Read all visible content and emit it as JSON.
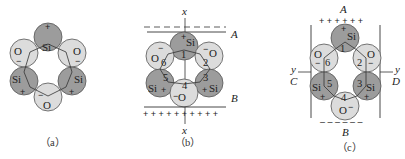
{
  "figure": {
    "colors": {
      "si_fill": "#9c9c9c",
      "o_fill": "#dcdcdc",
      "stroke": "#555555",
      "line": "#333333"
    },
    "panels": [
      {
        "id": "a",
        "caption": "（a）",
        "atoms": [
          {
            "element": "Si",
            "charge": "+"
          },
          {
            "element": "O",
            "charge": "−"
          },
          {
            "element": "Si",
            "charge": "+"
          },
          {
            "element": "O",
            "charge": "−"
          },
          {
            "element": "Si",
            "charge": "+"
          },
          {
            "element": "O",
            "charge": "−"
          }
        ]
      },
      {
        "id": "b",
        "caption": "（b）",
        "axis_label_top": "x",
        "axis_label_bottom": "x",
        "plate_top_label": "A",
        "plate_bottom_label": "B",
        "plate_top_charges": "– – – – – – – – –",
        "plate_bottom_charges": "+ + + + +  + + + + +",
        "atom_numbers": [
          "1",
          "2",
          "3",
          "4",
          "5",
          "6"
        ],
        "atoms": [
          {
            "element": "Si",
            "charge": "+",
            "number": "1"
          },
          {
            "element": "O",
            "charge": "−",
            "number": "2"
          },
          {
            "element": "Si",
            "charge": "+",
            "number": "3"
          },
          {
            "element": "O",
            "charge": "−",
            "number": "4"
          },
          {
            "element": "Si",
            "charge": "+",
            "number": "5"
          },
          {
            "element": "O",
            "charge": "−",
            "number": "6"
          }
        ]
      },
      {
        "id": "c",
        "caption": "（c）",
        "axis_label_left": "y",
        "axis_label_right": "y",
        "top_label": "A",
        "bottom_label": "B",
        "left_label": "C",
        "right_label": "D",
        "top_charges": "+ + + + + +",
        "bottom_charges": "– – – – – –",
        "atoms": [
          {
            "element": "Si",
            "charge": "+",
            "number": "1"
          },
          {
            "element": "O",
            "charge": "−",
            "number": "2"
          },
          {
            "element": "Si",
            "charge": "+",
            "number": "3"
          },
          {
            "element": "O",
            "charge": "−",
            "number": "4"
          },
          {
            "element": "Si",
            "charge": "+",
            "number": "5"
          },
          {
            "element": "O",
            "charge": "−",
            "number": "6"
          }
        ]
      }
    ]
  }
}
